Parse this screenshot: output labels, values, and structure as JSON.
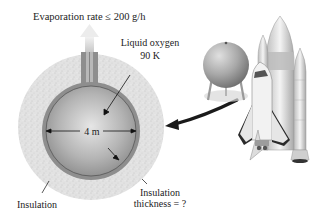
{
  "labels": {
    "evaporation": "Evaporation rate ≤ 200 g/h",
    "liquid_oxygen": "Liquid oxygen",
    "temperature": "90 K",
    "diameter": "4 m",
    "insulation": "Insulation",
    "insulation_thickness_1": "Insulation",
    "insulation_thickness_2": "thickness = ?"
  },
  "colors": {
    "insulation": "#e4e4e4",
    "tank_wall": "#8e8e8e",
    "tank_inner": "#b8b8b8",
    "arrow": "#1a1a1a"
  }
}
